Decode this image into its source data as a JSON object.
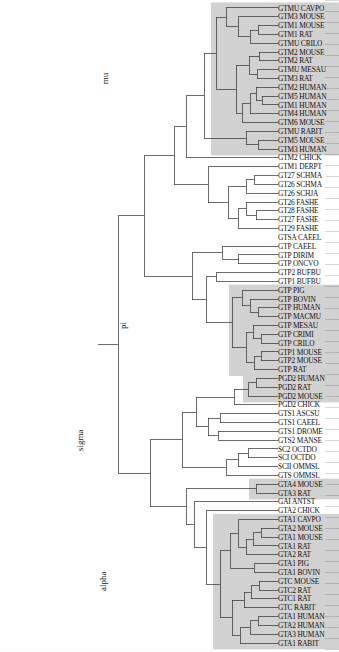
{
  "figure": {
    "type": "dendrogram",
    "title": "",
    "orientation": "rotated-180",
    "leaf_count": 101,
    "line_color": "#3a3a3a",
    "shade_color": "#d2d2d2"
  },
  "clades": [
    {
      "name": "alpha",
      "label": "alpha"
    },
    {
      "name": "sigma",
      "label": "sigma"
    },
    {
      "name": "pi",
      "label": "pi"
    },
    {
      "name": "mu",
      "label": "mu"
    }
  ],
  "tips": [
    {
      "i": 0,
      "label": "GTA1 RABIT",
      "clade": "alpha"
    },
    {
      "i": 1,
      "label": "GTA3 HUMAN",
      "clade": "alpha"
    },
    {
      "i": 2,
      "label": "GTA2 HUMAN",
      "clade": "alpha"
    },
    {
      "i": 3,
      "label": "GTA1 HUMAN",
      "clade": "alpha"
    },
    {
      "i": 4,
      "label": "GTC RABIT",
      "clade": "alpha"
    },
    {
      "i": 5,
      "label": "GTC1 RAT",
      "clade": "alpha"
    },
    {
      "i": 6,
      "label": "GTC2 RAT",
      "clade": "alpha"
    },
    {
      "i": 7,
      "label": "GTC MOUSE",
      "clade": "alpha"
    },
    {
      "i": 8,
      "label": "GTA1 BOVIN",
      "clade": "alpha"
    },
    {
      "i": 9,
      "label": "GTA1 PIG",
      "clade": "alpha"
    },
    {
      "i": 10,
      "label": "GTA2 RAT",
      "clade": "alpha"
    },
    {
      "i": 11,
      "label": "GTA1 RAT",
      "clade": "alpha"
    },
    {
      "i": 12,
      "label": "GTA1 MOUSE",
      "clade": "alpha"
    },
    {
      "i": 13,
      "label": "GTA2 MOUSE",
      "clade": "alpha"
    },
    {
      "i": 14,
      "label": "GTA1 CAVPO",
      "clade": "alpha"
    },
    {
      "i": 15,
      "label": "GTA2 CHICK",
      "clade": ""
    },
    {
      "i": 16,
      "label": "GAI ANTST",
      "clade": ""
    },
    {
      "i": 17,
      "label": "GTA3 RAT",
      "clade": "alpha2"
    },
    {
      "i": 18,
      "label": "GTA4 MOUSE",
      "clade": "alpha2"
    },
    {
      "i": 19,
      "label": "GTS OMMSL",
      "clade": ""
    },
    {
      "i": 20,
      "label": "SCII OMMSL",
      "clade": ""
    },
    {
      "i": 21,
      "label": "SCI OCTDO",
      "clade": ""
    },
    {
      "i": 22,
      "label": "SC2 OCTDO",
      "clade": ""
    },
    {
      "i": 23,
      "label": "GTS2 MANSE",
      "clade": ""
    },
    {
      "i": 24,
      "label": "GTS1 DROME",
      "clade": ""
    },
    {
      "i": 25,
      "label": "GTS1 CAEEL",
      "clade": ""
    },
    {
      "i": 26,
      "label": "GTS1 ASCSU",
      "clade": ""
    },
    {
      "i": 27,
      "label": "PGD2 CHICK",
      "clade": ""
    },
    {
      "i": 28,
      "label": "PGD2 MOUSE",
      "clade": "pgd"
    },
    {
      "i": 29,
      "label": "PGD2 RAT",
      "clade": "pgd"
    },
    {
      "i": 30,
      "label": "PGD2 HUMAN",
      "clade": "pgd"
    },
    {
      "i": 31,
      "label": "GTP RAT",
      "clade": "pi"
    },
    {
      "i": 32,
      "label": "GTP2 MOUSE",
      "clade": "pi"
    },
    {
      "i": 33,
      "label": "GTP1 MOUSE",
      "clade": "pi"
    },
    {
      "i": 34,
      "label": "GTP CRILO",
      "clade": "pi"
    },
    {
      "i": 35,
      "label": "GTP CRIMI",
      "clade": "pi"
    },
    {
      "i": 36,
      "label": "GTP MESAU",
      "clade": "pi"
    },
    {
      "i": 37,
      "label": "GTP MACMU",
      "clade": "pi"
    },
    {
      "i": 38,
      "label": "GTP HUMAN",
      "clade": "pi"
    },
    {
      "i": 39,
      "label": "GTP BOVIN",
      "clade": "pi"
    },
    {
      "i": 40,
      "label": "GTP PIG",
      "clade": "pi"
    },
    {
      "i": 41,
      "label": "GTP1 BUFBU",
      "clade": ""
    },
    {
      "i": 42,
      "label": "GTP2 BUFBU",
      "clade": ""
    },
    {
      "i": 43,
      "label": "GTP ONCVO",
      "clade": ""
    },
    {
      "i": 44,
      "label": "GTP DIRIM",
      "clade": ""
    },
    {
      "i": 45,
      "label": "GTP CAEEL",
      "clade": ""
    },
    {
      "i": 46,
      "label": "GTSA CAEEL",
      "clade": ""
    },
    {
      "i": 47,
      "label": "GT29 FASHE",
      "clade": ""
    },
    {
      "i": 48,
      "label": "GT27 FASHE",
      "clade": ""
    },
    {
      "i": 49,
      "label": "GT28 FASHE",
      "clade": ""
    },
    {
      "i": 50,
      "label": "GT26 FASHE",
      "clade": ""
    },
    {
      "i": 51,
      "label": "GT26 SCHJA",
      "clade": ""
    },
    {
      "i": 52,
      "label": "GT26 SCHMA",
      "clade": ""
    },
    {
      "i": 53,
      "label": "GT27 SCHMA",
      "clade": ""
    },
    {
      "i": 54,
      "label": "GTM1 DERPT",
      "clade": ""
    },
    {
      "i": 55,
      "label": "GTM2 CHICK",
      "clade": ""
    },
    {
      "i": 56,
      "label": "GTM3 HUMAN",
      "clade": "mu"
    },
    {
      "i": 57,
      "label": "GTM5 MOUSE",
      "clade": "mu"
    },
    {
      "i": 58,
      "label": "GTMU RABIT",
      "clade": "mu"
    },
    {
      "i": 59,
      "label": "GTM6 MOUSE",
      "clade": "mu"
    },
    {
      "i": 60,
      "label": "GTM4 HUMAN",
      "clade": "mu"
    },
    {
      "i": 61,
      "label": "GTM1 HUMAN",
      "clade": "mu"
    },
    {
      "i": 62,
      "label": "GTM5 HUMAN",
      "clade": "mu"
    },
    {
      "i": 63,
      "label": "GTM2 HUMAN",
      "clade": "mu"
    },
    {
      "i": 64,
      "label": "GTM3 RAT",
      "clade": "mu"
    },
    {
      "i": 65,
      "label": "GTMU MESAU",
      "clade": "mu"
    },
    {
      "i": 66,
      "label": "GTM2 RAT",
      "clade": "mu"
    },
    {
      "i": 67,
      "label": "GTM2 MOUSE",
      "clade": "mu"
    },
    {
      "i": 68,
      "label": "GTMU CRILO",
      "clade": "mu"
    },
    {
      "i": 69,
      "label": "GTM1 RAT",
      "clade": "mu"
    },
    {
      "i": 70,
      "label": "GTM1 MOUSE",
      "clade": "mu"
    },
    {
      "i": 71,
      "label": "GTM3 MOUSE",
      "clade": "mu"
    },
    {
      "i": 72,
      "label": "GTMU CAVPO",
      "clade": "mu"
    }
  ],
  "shaded_boxes": [
    {
      "name": "alpha-box",
      "from": 0,
      "to": 14,
      "x": 0,
      "w": 126
    },
    {
      "name": "alpha2-box",
      "from": 17,
      "to": 18,
      "x": 0,
      "w": 90
    },
    {
      "name": "pgd-box",
      "from": 28,
      "to": 30,
      "x": 0,
      "w": 96
    },
    {
      "name": "pi-box",
      "from": 31,
      "to": 40,
      "x": 0,
      "w": 110
    },
    {
      "name": "mu-box",
      "from": 56,
      "to": 72,
      "x": 0,
      "w": 128
    }
  ],
  "clade_label_positions": [
    {
      "name": "alpha",
      "tip": 7,
      "depth": 172
    },
    {
      "name": "sigma",
      "tip": 23,
      "depth": 195
    },
    {
      "name": "pi",
      "tip": 36,
      "depth": 152
    },
    {
      "name": "mu",
      "tip": 64,
      "depth": 170
    }
  ]
}
